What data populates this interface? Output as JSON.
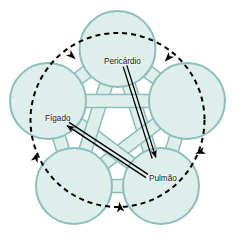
{
  "diagram": {
    "type": "pentagram-cycle",
    "colors": {
      "node_fill": "#ddeeeb",
      "node_stroke": "#8dbebb",
      "band_fill": "#ddeeeb",
      "band_stroke": "#8dbebb",
      "arrow_color": "#000000",
      "dashed_circle_color": "#000000",
      "background": "#ffffff",
      "label_color": "#15201f"
    },
    "nodes": [
      {
        "id": "top",
        "label": "Pericárdio",
        "labelled": true,
        "cx": 117.5,
        "cy": 49,
        "r": 38
      },
      {
        "id": "right",
        "label": "",
        "labelled": false,
        "cx": 187,
        "cy": 101,
        "r": 38
      },
      {
        "id": "bottom-right",
        "label": "Pulmão",
        "labelled": true,
        "cx": 161,
        "cy": 186,
        "r": 38
      },
      {
        "id": "bottom-left",
        "label": "",
        "labelled": false,
        "cx": 74,
        "cy": 186,
        "r": 38
      },
      {
        "id": "left",
        "label": "Fígado",
        "labelled": true,
        "cx": 48,
        "cy": 101,
        "r": 38
      }
    ],
    "labels": [
      {
        "name": "label-pericardio",
        "text": "Pericárdio",
        "x": 104,
        "y": 64
      },
      {
        "name": "label-figado",
        "text": "Fígado",
        "x": 45,
        "y": 121
      },
      {
        "name": "label-pulmao",
        "text": "Pulmão",
        "x": 149,
        "y": 181
      }
    ],
    "dashed_circle": {
      "name": "dashed-cycle-circle",
      "cx": 117.5,
      "cy": 120,
      "r": 87,
      "direction": "clockwise",
      "dash": "5 4",
      "stroke_width": 2,
      "arrow_markers": [
        {
          "name": "dashed-arrow-top-left",
          "x": 72,
          "y": 56,
          "angle": 42
        },
        {
          "name": "dashed-arrow-top-right",
          "x": 168,
          "y": 58,
          "angle": 132
        },
        {
          "name": "dashed-arrow-right",
          "x": 200,
          "y": 152,
          "angle": 160
        },
        {
          "name": "dashed-arrow-bottom",
          "x": 120,
          "y": 207,
          "angle": 262
        },
        {
          "name": "dashed-arrow-left",
          "x": 36,
          "y": 157,
          "angle": 290
        }
      ]
    },
    "solid_arrows": [
      {
        "name": "arrow-pericardio-to-lower-right",
        "from": "Pericárdio",
        "to": "",
        "x1": 125,
        "y1": 66,
        "x2": 154,
        "y2": 158,
        "double_line": true
      },
      {
        "name": "arrow-pulmao-to-figado",
        "from": "Pulmão",
        "to": "Fígado",
        "x1": 147,
        "y1": 176,
        "x2": 68,
        "y2": 124,
        "double_line": true
      }
    ]
  }
}
